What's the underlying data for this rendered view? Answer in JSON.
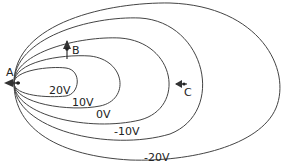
{
  "diagram": {
    "type": "equipotential-lines",
    "line_color": "#444444",
    "text_color": "#222222",
    "equipotentials": [
      {
        "label": "20V",
        "value": 20
      },
      {
        "label": "10V",
        "value": 10
      },
      {
        "label": "0V",
        "value": 0
      },
      {
        "label": "-10V",
        "value": -10
      },
      {
        "label": "-20V",
        "value": -20
      }
    ],
    "points": [
      {
        "label": "A",
        "arrow": "left"
      },
      {
        "label": "B",
        "arrow": "up"
      },
      {
        "label": "C",
        "arrow": "left"
      }
    ]
  }
}
